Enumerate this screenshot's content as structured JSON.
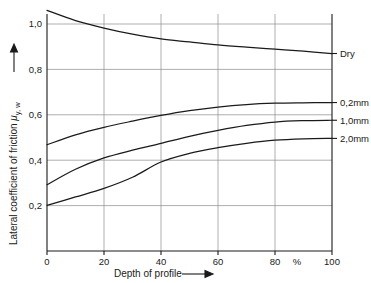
{
  "chart_data": {
    "type": "line",
    "title": "",
    "xlabel": "Depth of profile",
    "ylabel": "Lateral coefficient of friction",
    "ylabel_symbol": "μ",
    "ylabel_subscript": "y, w",
    "xunit": "%",
    "xlim": [
      0,
      100
    ],
    "ylim": [
      0,
      1.1
    ],
    "xticks": [
      0,
      20,
      40,
      60,
      80,
      100
    ],
    "xtick_labels": [
      "0",
      "20",
      "40",
      "60",
      "80",
      "100"
    ],
    "yticks": [
      0.2,
      0.4,
      0.6,
      0.8,
      1.0
    ],
    "ytick_labels": [
      "0,2",
      "0,4",
      "0,6",
      "0,8",
      "1,0"
    ],
    "grid": true,
    "legend_position": "right-inline",
    "x": [
      0,
      10,
      20,
      30,
      40,
      50,
      60,
      70,
      80,
      90,
      100
    ],
    "series": [
      {
        "name": "Dry",
        "label": "Dry",
        "values": [
          1.06,
          1.015,
          0.982,
          0.955,
          0.934,
          0.921,
          0.908,
          0.898,
          0.889,
          0.88,
          0.87
        ]
      },
      {
        "name": "0,2mm",
        "label": "0,2mm",
        "values": [
          0.468,
          0.512,
          0.545,
          0.572,
          0.597,
          0.618,
          0.634,
          0.645,
          0.651,
          0.653,
          0.654
        ]
      },
      {
        "name": "1,0mm",
        "label": "1,0mm",
        "values": [
          0.292,
          0.36,
          0.41,
          0.444,
          0.474,
          0.505,
          0.531,
          0.553,
          0.568,
          0.574,
          0.576
        ]
      },
      {
        "name": "2,0mm",
        "label": "2,0mm",
        "values": [
          0.201,
          0.238,
          0.276,
          0.325,
          0.392,
          0.43,
          0.455,
          0.474,
          0.488,
          0.494,
          0.496
        ]
      }
    ]
  },
  "axes": {
    "x_arrow": "arrow-right",
    "y_arrow": "arrow-up"
  }
}
